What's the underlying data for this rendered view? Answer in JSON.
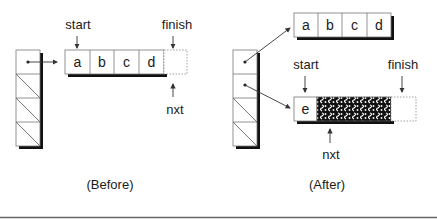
{
  "before": {
    "caption": "(Before)",
    "array_cells": [
      "a",
      "b",
      "c",
      "d"
    ],
    "labels": {
      "start": "start",
      "finish": "finish",
      "nxt": "nxt"
    },
    "column_cells": [
      "pointer",
      "empty",
      "empty",
      "empty"
    ]
  },
  "after": {
    "caption": "(After)",
    "old_array_cells": [
      "a",
      "b",
      "c",
      "d"
    ],
    "new_array_cells": [
      "e"
    ],
    "new_array_garbage_cells": 3,
    "labels": {
      "start": "start",
      "finish": "finish",
      "nxt": "nxt"
    },
    "column_cells": [
      "pointer",
      "pointer",
      "empty",
      "empty"
    ]
  },
  "colors": {
    "stroke": "#6a6a6a",
    "shadow": "#111111",
    "text": "#1a1a1a",
    "dotted": "#888888"
  }
}
